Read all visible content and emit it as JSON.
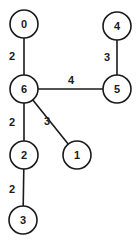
{
  "graph": {
    "node_radius": 14,
    "colors": {
      "stroke": "#1a1a1a",
      "fill": "#ffffff",
      "background": "#ffffff"
    },
    "nodes": [
      {
        "id": "0",
        "label": "0",
        "x": 24,
        "y": 24
      },
      {
        "id": "4",
        "label": "4",
        "x": 117,
        "y": 26
      },
      {
        "id": "6",
        "label": "6",
        "x": 24,
        "y": 89
      },
      {
        "id": "5",
        "label": "5",
        "x": 117,
        "y": 89
      },
      {
        "id": "2",
        "label": "2",
        "x": 24,
        "y": 155
      },
      {
        "id": "1",
        "label": "1",
        "x": 77,
        "y": 155
      },
      {
        "id": "3",
        "label": "3",
        "x": 23,
        "y": 220
      }
    ],
    "edges": [
      {
        "from": "0",
        "to": "6",
        "weight": "2",
        "label_x": 12,
        "label_y": 56
      },
      {
        "from": "4",
        "to": "5",
        "weight": "3",
        "label_x": 107,
        "label_y": 57
      },
      {
        "from": "6",
        "to": "5",
        "weight": "4",
        "label_x": 71,
        "label_y": 80
      },
      {
        "from": "6",
        "to": "2",
        "weight": "2",
        "label_x": 12,
        "label_y": 122
      },
      {
        "from": "6",
        "to": "1",
        "weight": "3",
        "label_x": 47,
        "label_y": 121
      },
      {
        "from": "2",
        "to": "3",
        "weight": "2",
        "label_x": 12,
        "label_y": 189
      }
    ]
  }
}
